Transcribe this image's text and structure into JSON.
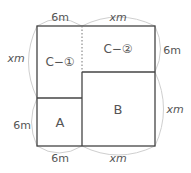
{
  "diagram": {
    "regions": {
      "c1": "C−①",
      "c2": "C−②",
      "a": "A",
      "b": "B"
    },
    "dimensions": {
      "top_left": "6m",
      "top_right": "xm",
      "left_top": "xm",
      "left_bottom": "6m",
      "right_top": "6m",
      "right_bottom": "xm",
      "bottom_left": "6m",
      "bottom_right": "xm"
    },
    "colors": {
      "line": "#444444",
      "arc": "#cccccc",
      "text": "#555555"
    }
  }
}
